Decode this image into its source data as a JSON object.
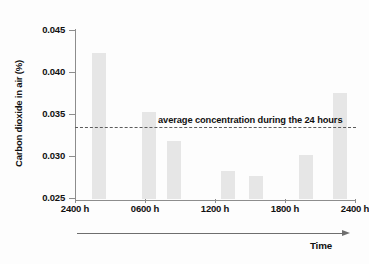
{
  "chart_data": {
    "type": "bar",
    "title": "",
    "xlabel": "Time",
    "ylabel": "Carbon dioxide in air (%)",
    "ylim": [
      0.025,
      0.045
    ],
    "yticks": [
      "0.025",
      "0.030",
      "0.035",
      "0.040",
      "0.045"
    ],
    "ytick_values": [
      0.025,
      0.03,
      0.035,
      0.04,
      0.045
    ],
    "grid": false,
    "legend": "none",
    "categories": [
      "2400 h",
      "0300 h",
      "0600 h",
      "0900 h",
      "1200 h",
      "1500 h",
      "1800 h",
      "2100 h",
      "2400 h"
    ],
    "xtick_labels": [
      "2400 h",
      "0600 h",
      "1200 h",
      "1800 h",
      "2400 h"
    ],
    "xtick_positions": [
      0,
      2,
      4,
      6,
      8
    ],
    "values": [
      0.0424,
      null,
      0.0354,
      0.0319,
      0.0283,
      0.0277,
      0.0302,
      null,
      0.0376
    ],
    "bars": [
      {
        "label": "2400 h",
        "x_frac": 0.085,
        "value": 0.0424
      },
      {
        "label": "0600 h",
        "x_frac": 0.265,
        "value": 0.0354
      },
      {
        "label": "0900 h",
        "x_frac": 0.355,
        "value": 0.0319
      },
      {
        "label": "1200 h",
        "x_frac": 0.545,
        "value": 0.0283
      },
      {
        "label": "1500 h",
        "x_frac": 0.645,
        "value": 0.0277
      },
      {
        "label": "1800 h",
        "x_frac": 0.825,
        "value": 0.0302
      },
      {
        "label": "2400 h",
        "x_frac": 0.945,
        "value": 0.0376
      }
    ],
    "annotations": [
      {
        "name": "average-concentration-line",
        "text": "average concentration during the 24 hours",
        "value": 0.0334,
        "style": "dashed"
      }
    ],
    "colors": {
      "bar_fill": "#e6e6e6",
      "axis": "#8d8d8d",
      "text": "#111111",
      "dash_line": "#5c5c5c",
      "background": "#fdfdfd"
    }
  }
}
